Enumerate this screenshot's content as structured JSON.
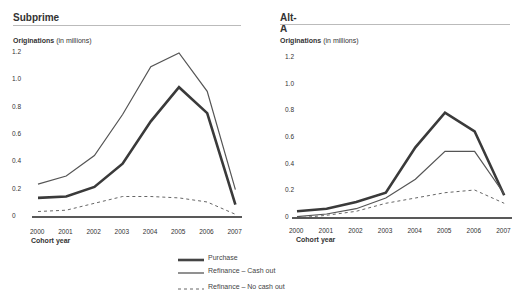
{
  "legend": [
    {
      "label": "Purchase",
      "style": "thick"
    },
    {
      "label": "Refinance – Cash out",
      "style": "thin"
    },
    {
      "label": "Refinance – No cash out",
      "style": "dashed"
    }
  ],
  "panels": [
    {
      "title": "Subprime",
      "ylabel_bold": "Originations",
      "ylabel_rest": " (in millions)",
      "xlabel": "Cohort year"
    },
    {
      "title": "Alt-A",
      "ylabel_bold": "Originations",
      "ylabel_rest": " (in millions)",
      "xlabel": "Cohort year"
    }
  ],
  "chart_data": [
    {
      "type": "line",
      "title": "Subprime",
      "xlabel": "Cohort year",
      "ylabel": "Originations (in millions)",
      "ylim": [
        0,
        1.2
      ],
      "yticks": [
        "0",
        "0.2",
        "0.4",
        "0.6",
        "0.8",
        "1.0",
        "1.2"
      ],
      "categories": [
        "2000",
        "2001",
        "2002",
        "2003",
        "2004",
        "2005",
        "2006",
        "2007"
      ],
      "series": [
        {
          "name": "Purchase",
          "values": [
            0.14,
            0.15,
            0.22,
            0.39,
            0.7,
            0.95,
            0.76,
            0.09
          ]
        },
        {
          "name": "Refinance – Cash out",
          "values": [
            0.24,
            0.3,
            0.45,
            0.75,
            1.1,
            1.2,
            0.92,
            0.2
          ]
        },
        {
          "name": "Refinance – No cash out",
          "values": [
            0.04,
            0.05,
            0.1,
            0.15,
            0.15,
            0.14,
            0.11,
            0.02
          ]
        }
      ],
      "grid": false,
      "legend_position": "bottom-center"
    },
    {
      "type": "line",
      "title": "Alt-A",
      "xlabel": "Cohort year",
      "ylabel": "Originations (in millions)",
      "ylim": [
        0,
        1.2
      ],
      "yticks": [
        "0",
        "0.2",
        "0.4",
        "0.6",
        "0.8",
        "1.0",
        "1.2"
      ],
      "categories": [
        "2000",
        "2001",
        "2002",
        "2003",
        "2004",
        "2005",
        "2006",
        "2007"
      ],
      "series": [
        {
          "name": "Purchase",
          "values": [
            0.05,
            0.07,
            0.12,
            0.19,
            0.53,
            0.79,
            0.65,
            0.17
          ]
        },
        {
          "name": "Refinance – Cash out",
          "values": [
            0.01,
            0.03,
            0.07,
            0.15,
            0.29,
            0.5,
            0.5,
            0.18
          ]
        },
        {
          "name": "Refinance – No cash out",
          "values": [
            0.0,
            0.02,
            0.05,
            0.11,
            0.15,
            0.19,
            0.21,
            0.11
          ]
        }
      ],
      "grid": false,
      "legend_position": "bottom-center"
    }
  ]
}
